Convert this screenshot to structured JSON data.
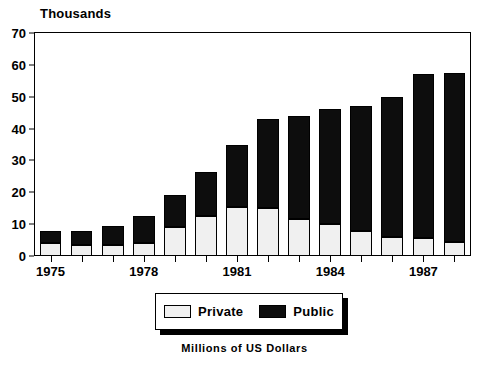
{
  "chart_data": {
    "type": "bar",
    "stacked": true,
    "title": "",
    "subtitle": "",
    "y_unit_label": "Thousands",
    "caption": "Millions of US Dollars",
    "xlabel": "",
    "ylabel": "Thousands",
    "ylim": [
      0,
      70
    ],
    "yticks": [
      0,
      10,
      20,
      30,
      40,
      50,
      60,
      70
    ],
    "ytick_labels": [
      "0",
      "10",
      "20",
      "30",
      "40",
      "50",
      "60",
      "70"
    ],
    "grid": false,
    "legend_position": "below-axes",
    "categories": [
      "1975",
      "1976",
      "1977",
      "1978",
      "1979",
      "1980",
      "1981",
      "1982",
      "1983",
      "1984",
      "1985",
      "1986",
      "1987",
      "1988"
    ],
    "xtick_labels": [
      "1975",
      "1978",
      "1981",
      "1984",
      "1987"
    ],
    "xtick_category_index": [
      0,
      3,
      6,
      9,
      12
    ],
    "series": [
      {
        "name": "Private",
        "color": "#f0f0f0",
        "values": [
          4,
          3.5,
          3.5,
          4,
          9,
          12.5,
          15.5,
          15,
          11.5,
          10,
          8,
          6,
          5.5,
          4.5
        ]
      },
      {
        "name": "Public",
        "color": "#0d0d0d",
        "values": [
          4,
          4.5,
          6,
          8.5,
          10,
          14,
          19.5,
          28,
          32.5,
          36,
          39,
          44,
          51.5,
          53
        ]
      }
    ],
    "totals": [
      8,
      8,
      9.5,
      12.5,
      19,
      26.5,
      35,
      43,
      44,
      46,
      47,
      50,
      57,
      57.5
    ]
  },
  "legend": {
    "entries": [
      {
        "label": "Private",
        "swatch": "private"
      },
      {
        "label": "Public",
        "swatch": "public"
      }
    ]
  }
}
